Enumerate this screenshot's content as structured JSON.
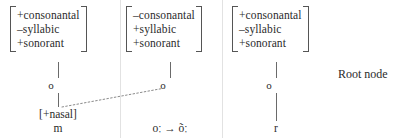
{
  "diagram": {
    "root_node_label": "Root node",
    "columns": [
      {
        "id": "column-nasal-consonant",
        "features": [
          "+consonantal",
          "–syllabic",
          "+sonorant"
        ],
        "root_node_glyph": "o",
        "feature_node": "[+nasal]",
        "segment": "m"
      },
      {
        "id": "column-vowel",
        "features": [
          "–consonantal",
          "+syllabic",
          "+sonorant"
        ],
        "root_node_glyph": "o",
        "feature_node": "",
        "segment": "oː → õː"
      },
      {
        "id": "column-rhotic",
        "features": [
          "+consonantal",
          "–syllabic",
          "+sonorant"
        ],
        "root_node_glyph": "o",
        "feature_node": "",
        "segment": "r"
      }
    ],
    "colors": {
      "text": "#2b2b2b",
      "line": "#6a6a6a",
      "bracket": "#555555",
      "divider": "#e2e2e2",
      "dotted_link": "#8a8a8a"
    }
  }
}
